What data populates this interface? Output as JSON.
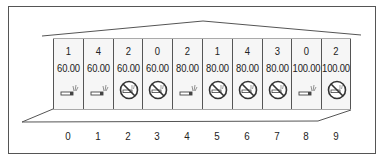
{
  "diagram": {
    "type": "seat-map",
    "rooms": [
      {
        "index": "0",
        "count": "1",
        "price": "60.00",
        "icon": "smoking-icon"
      },
      {
        "index": "1",
        "count": "4",
        "price": "60.00",
        "icon": "smoking-icon"
      },
      {
        "index": "2",
        "count": "2",
        "price": "60.00",
        "icon": "no-smoking-icon"
      },
      {
        "index": "3",
        "count": "0",
        "price": "60.00",
        "icon": "no-smoking-icon"
      },
      {
        "index": "4",
        "count": "2",
        "price": "80.00",
        "icon": "smoking-icon"
      },
      {
        "index": "5",
        "count": "1",
        "price": "80.00",
        "icon": "no-smoking-icon"
      },
      {
        "index": "6",
        "count": "4",
        "price": "80.00",
        "icon": "no-smoking-icon"
      },
      {
        "index": "7",
        "count": "3",
        "price": "80.00",
        "icon": "no-smoking-icon"
      },
      {
        "index": "8",
        "count": "0",
        "price": "100.00",
        "icon": "smoking-icon"
      },
      {
        "index": "9",
        "count": "2",
        "price": "100.00",
        "icon": "no-smoking-icon"
      }
    ]
  },
  "colors": {
    "line": "#555555",
    "text": "#222222",
    "cell_bg": "#f6f6f6"
  }
}
